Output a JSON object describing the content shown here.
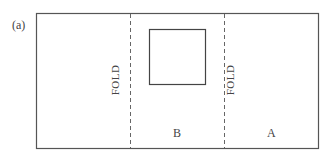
{
  "figure": {
    "label": "(a)",
    "fold_left": "FOLD",
    "fold_right": "FOLD",
    "panel_b": "B",
    "panel_a": "A",
    "colors": {
      "line": "#555555",
      "text": "#444444",
      "background": "#ffffff"
    }
  }
}
